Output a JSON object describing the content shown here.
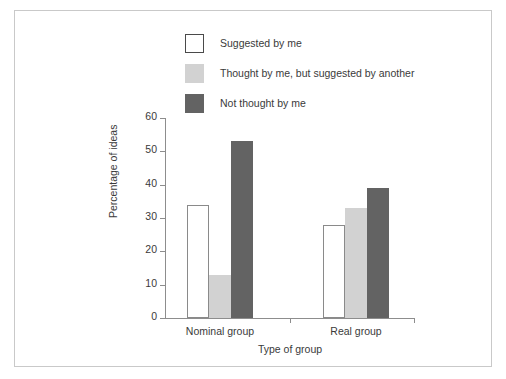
{
  "chart_data": {
    "type": "bar",
    "title": "",
    "xlabel": "Type of group",
    "ylabel": "Percentage of ideas",
    "categories": [
      "Nominal group",
      "Real group"
    ],
    "series": [
      {
        "name": "Suggested by me",
        "color": "#ffffff",
        "values": [
          34,
          28
        ]
      },
      {
        "name": "Thought by me, but suggested by another",
        "color": "#d2d2d2",
        "values": [
          13,
          33
        ]
      },
      {
        "name": "Not thought by me",
        "color": "#636363",
        "values": [
          53,
          39
        ]
      }
    ],
    "ylim": [
      0,
      60
    ],
    "yticks": [
      0,
      10,
      20,
      30,
      40,
      50,
      60
    ],
    "ytick_labels": [
      "0",
      "10",
      "20",
      "30",
      "40",
      "50",
      "60"
    ],
    "grid": false,
    "legend_position": "top-left"
  },
  "legend": {
    "items": [
      {
        "label": "Suggested by me",
        "swatch": "open-square-swatch"
      },
      {
        "label": "Thought by me, but suggested by another",
        "swatch": "light-gray-square-swatch"
      },
      {
        "label": "Not thought by me",
        "swatch": "dark-gray-square-swatch"
      }
    ]
  },
  "axes": {
    "y_title": "Percentage of ideas",
    "x_title": "Type of group",
    "y_ticks": [
      "60",
      "50",
      "40",
      "30",
      "20",
      "10",
      "0"
    ],
    "x_categories": [
      "Nominal group",
      "Real group"
    ]
  }
}
